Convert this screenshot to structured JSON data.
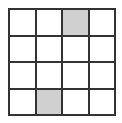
{
  "grid": {
    "rows": 4,
    "cols": 4,
    "shaded_color": "#d0d0d0",
    "line_color": "#333333",
    "shaded_cells": [
      {
        "row": 0,
        "col": 2
      },
      {
        "row": 3,
        "col": 1
      }
    ]
  }
}
